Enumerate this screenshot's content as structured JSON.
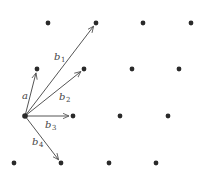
{
  "diagram": {
    "type": "lattice-vectors",
    "colors": {
      "dot": "#2a2a2a",
      "arrow": "#555555",
      "label": "#444444"
    },
    "lattice_points": [
      [
        48,
        23
      ],
      [
        96,
        23
      ],
      [
        143,
        23
      ],
      [
        191,
        23
      ],
      [
        37,
        69
      ],
      [
        84,
        69
      ],
      [
        132,
        69
      ],
      [
        179,
        69
      ],
      [
        25,
        116
      ],
      [
        73,
        116
      ],
      [
        120,
        116
      ],
      [
        168,
        116
      ],
      [
        14,
        163
      ],
      [
        61,
        163
      ],
      [
        109,
        163
      ],
      [
        156,
        163
      ]
    ],
    "origin": [
      25,
      116
    ],
    "vectors": [
      {
        "name": "a",
        "base": "a",
        "sub": "",
        "to": [
          37,
          69
        ],
        "label_pos": [
          22,
          99
        ]
      },
      {
        "name": "b1",
        "base": "b",
        "sub": "1",
        "to": [
          96,
          23
        ],
        "label_pos": [
          54,
          60
        ]
      },
      {
        "name": "b2",
        "base": "b",
        "sub": "2",
        "to": [
          84,
          69
        ],
        "label_pos": [
          59,
          100
        ]
      },
      {
        "name": "b3",
        "base": "b",
        "sub": "3",
        "to": [
          73,
          116
        ],
        "label_pos": [
          45,
          128
        ]
      },
      {
        "name": "b4",
        "base": "b",
        "sub": "4",
        "to": [
          61,
          163
        ],
        "label_pos": [
          32,
          145
        ]
      }
    ]
  }
}
